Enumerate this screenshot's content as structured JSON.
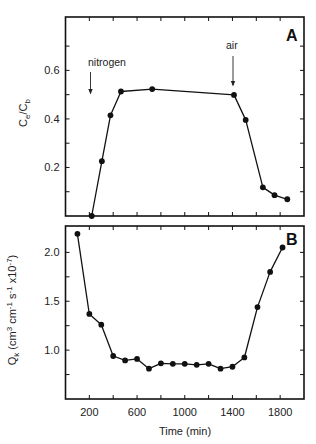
{
  "chart_data": [
    {
      "panel": "A",
      "type": "line",
      "title": "",
      "panel_label": "A",
      "xlabel": "",
      "ylabel": "Ce/Cb",
      "ylabel_main": "C",
      "ylabel_sub1": "e",
      "ylabel_mid": "/C",
      "ylabel_sub2": "b",
      "xlim": [
        0,
        2000
      ],
      "ylim": [
        0,
        0.82
      ],
      "xticks": [
        200,
        400,
        600,
        800,
        1000,
        1200,
        1400,
        1600,
        1800
      ],
      "xtick_labels_shown": false,
      "yticks_major": [
        0.2,
        0.4,
        0.6
      ],
      "ytick_labels": [
        "0.2",
        "0.4",
        "0.6"
      ],
      "yticks_minor": [
        0.1,
        0.3,
        0.5,
        0.7
      ],
      "grid": false,
      "marker": "filled-circle",
      "x": [
        220,
        305,
        377,
        465,
        727,
        1413,
        1511,
        1655,
        1753,
        1860
      ],
      "y": [
        0.0,
        0.226,
        0.415,
        0.513,
        0.523,
        0.499,
        0.396,
        0.118,
        0.086,
        0.069
      ],
      "annotations": [
        {
          "text": "nitrogen",
          "x": 215,
          "arrow": true
        },
        {
          "text": "air",
          "x": 1413,
          "arrow": true
        }
      ]
    },
    {
      "panel": "B",
      "type": "line",
      "title": "",
      "panel_label": "B",
      "xlabel": "Time (min)",
      "ylabel": "Qk (cm3 cm-1 s-1 x10-7)",
      "xlim": [
        0,
        2000
      ],
      "ylim": [
        0.5,
        2.27
      ],
      "xticks": [
        200,
        400,
        600,
        800,
        1000,
        1200,
        1400,
        1600,
        1800
      ],
      "xtick_labels": [
        "200",
        "600",
        "1000",
        "1400",
        "1800"
      ],
      "xtick_label_values": [
        200,
        600,
        1000,
        1400,
        1800
      ],
      "yticks_major": [
        1.0,
        1.5,
        2.0
      ],
      "ytick_labels": [
        "1.0",
        "1.5",
        "2.0"
      ],
      "yticks_minor": [
        0.75,
        1.25,
        1.75
      ],
      "grid": false,
      "marker": "filled-circle",
      "x": [
        100,
        200,
        300,
        400,
        500,
        600,
        700,
        800,
        900,
        1000,
        1100,
        1200,
        1300,
        1400,
        1500,
        1610,
        1716,
        1820
      ],
      "y": [
        2.19,
        1.37,
        1.26,
        0.94,
        0.895,
        0.91,
        0.81,
        0.865,
        0.86,
        0.86,
        0.85,
        0.86,
        0.81,
        0.83,
        0.925,
        1.44,
        1.8,
        2.05
      ]
    }
  ],
  "labels": {
    "panel_a_letter": "A",
    "panel_b_letter": "B",
    "nitrogen": "nitrogen",
    "air": "air",
    "x_axis_title": "Time (min)",
    "panel_a_ylabel": "Ce/Cb",
    "panel_b_ylabel_q": "Q",
    "panel_b_ylabel_k": "k",
    "panel_b_ylabel_rest": " (cm",
    "panel_b_ylabel_sup3": "3",
    "panel_b_ylabel_cm": " cm",
    "panel_b_ylabel_supm1a": "-1",
    "panel_b_ylabel_s": " s",
    "panel_b_ylabel_supm1b": "-1",
    "panel_b_ylabel_x": " x10",
    "panel_b_ylabel_supm7": "-7",
    "panel_b_ylabel_close": ")"
  },
  "colors": {
    "line": "#111111",
    "marker": "#111111",
    "axis": "#111111",
    "text": "#222222",
    "background": "#ffffff"
  }
}
